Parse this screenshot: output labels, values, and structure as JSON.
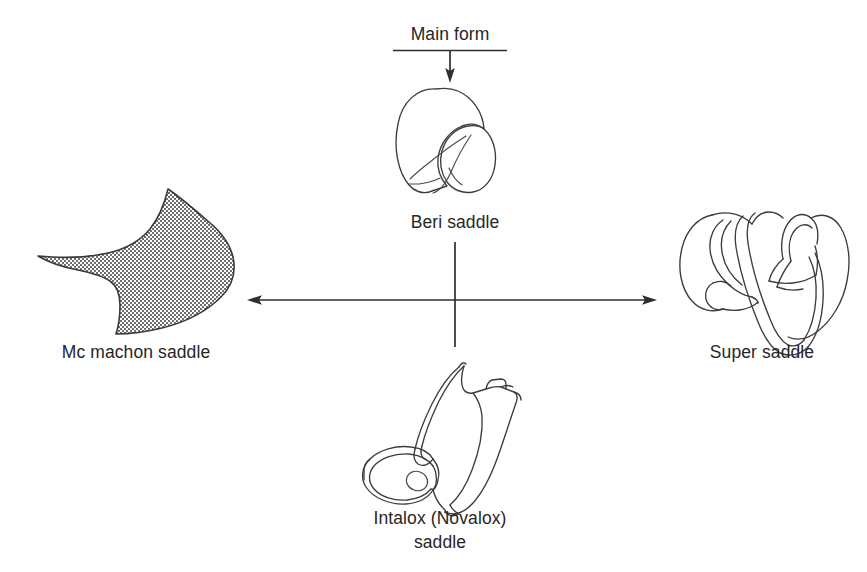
{
  "figure": {
    "title_label": "Main form",
    "background_color": "#ffffff",
    "line_color": "#3c3c41",
    "text_color": "#262626"
  },
  "nodes": {
    "center": {
      "id": "beri-saddle",
      "label": "Beri saddle",
      "icon": "beri-saddle-shape",
      "position": "top-center"
    },
    "left": {
      "id": "mc-machon-saddle",
      "label": "Mc machon saddle",
      "icon": "mc-machon-saddle-shape",
      "position": "left",
      "fill_pattern": "crosshatch"
    },
    "right": {
      "id": "super-saddle",
      "label": "Super saddle",
      "icon": "super-saddle-shape",
      "position": "right"
    },
    "bottom": {
      "id": "intalox-novalox-saddle",
      "label_line1": "Intalox (Novalox)",
      "label_line2": "saddle",
      "icon": "intalox-saddle-shape",
      "position": "bottom-center"
    }
  },
  "connectors": {
    "main_form_arrow": "arrow-down",
    "horizontal_arrow": "arrow-both-directions",
    "vertical_line": "line-plain"
  }
}
